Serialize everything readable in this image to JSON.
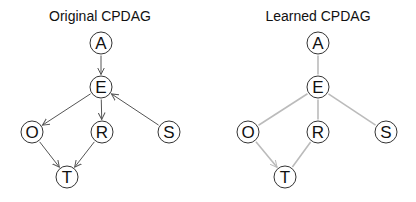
{
  "colors": {
    "background": "#ffffff",
    "node_stroke": "#333333",
    "original_edge": "#555555",
    "learned_edge": "#bbbbbb",
    "text": "#111111"
  },
  "node_radius": 11,
  "graphs": [
    {
      "title": "Original CPDAG",
      "title_pos": {
        "x": 100,
        "y": 21
      },
      "edge_color": "#555555",
      "nodes": [
        {
          "id": "A",
          "label": "A",
          "x": 101,
          "y": 43
        },
        {
          "id": "E",
          "label": "E",
          "x": 101,
          "y": 87
        },
        {
          "id": "O",
          "label": "O",
          "x": 32,
          "y": 132
        },
        {
          "id": "R",
          "label": "R",
          "x": 102,
          "y": 132
        },
        {
          "id": "S",
          "label": "S",
          "x": 169,
          "y": 132
        },
        {
          "id": "T",
          "label": "T",
          "x": 67,
          "y": 177
        }
      ],
      "edges": [
        {
          "from": "A",
          "to": "E",
          "directed": true
        },
        {
          "from": "E",
          "to": "O",
          "directed": true
        },
        {
          "from": "E",
          "to": "R",
          "directed": true
        },
        {
          "from": "S",
          "to": "E",
          "directed": true
        },
        {
          "from": "O",
          "to": "T",
          "directed": true
        },
        {
          "from": "R",
          "to": "T",
          "directed": true
        }
      ]
    },
    {
      "title": "Learned CPDAG",
      "title_pos": {
        "x": 318,
        "y": 21
      },
      "edge_color": "#bbbbbb",
      "nodes": [
        {
          "id": "A",
          "label": "A",
          "x": 318,
          "y": 43
        },
        {
          "id": "E",
          "label": "E",
          "x": 318,
          "y": 87
        },
        {
          "id": "O",
          "label": "O",
          "x": 248,
          "y": 132
        },
        {
          "id": "R",
          "label": "R",
          "x": 318,
          "y": 132
        },
        {
          "id": "S",
          "label": "S",
          "x": 386,
          "y": 132
        },
        {
          "id": "T",
          "label": "T",
          "x": 285,
          "y": 177
        }
      ],
      "edges": [
        {
          "from": "A",
          "to": "E",
          "directed": false
        },
        {
          "from": "E",
          "to": "O",
          "directed": false
        },
        {
          "from": "E",
          "to": "R",
          "directed": false
        },
        {
          "from": "E",
          "to": "S",
          "directed": false
        },
        {
          "from": "O",
          "to": "T",
          "directed": true
        },
        {
          "from": "R",
          "to": "T",
          "directed": false
        }
      ]
    }
  ]
}
